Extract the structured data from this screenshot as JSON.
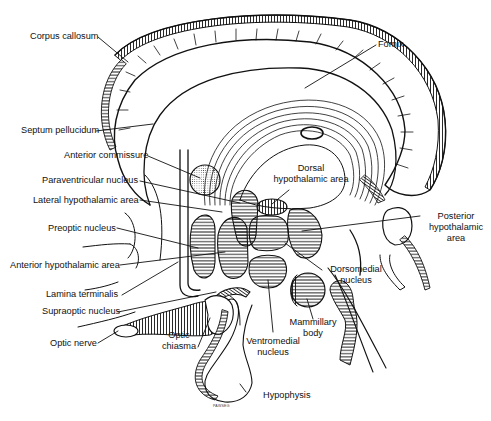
{
  "figure": {
    "ink_color": "#111111",
    "background_color": "#ffffff",
    "signature": "PAWSEG"
  },
  "labels": {
    "corpus_callosum": "Corpus callosum",
    "fornix": "Fornix",
    "septum_pellucidum": "Septum pellucidum",
    "anterior_commissure": "Anterior commissure",
    "paraventricular_nucleus": "Paraventricular nucleus",
    "lateral_hypothalamic_area": "Lateral hypothalamic area",
    "preoptic_nucleus": "Preoptic nucleus",
    "anterior_hypothalamic_area": "Anterior hypothalamic area",
    "lamina_terminalis": "Lamina terminalis",
    "supraoptic_nucleus": "Supraoptic nucleus",
    "optic_nerve": "Optic nerve",
    "optic_chiasma_1": "Optic",
    "optic_chiasma_2": "chiasma",
    "dorsal_hypothalamic_area_1": "Dorsal",
    "dorsal_hypothalamic_area_2": "hypothalamic area",
    "posterior_hypothalamic_area_1": "Posterior",
    "posterior_hypothalamic_area_2": "hypothalamic",
    "posterior_hypothalamic_area_3": "area",
    "dorsomedial_nucleus_1": "Dorsomedial",
    "dorsomedial_nucleus_2": "nucleus",
    "mammillary_body_1": "Mammillary",
    "mammillary_body_2": "body",
    "ventromedial_nucleus_1": "Ventromedial",
    "ventromedial_nucleus_2": "nucleus",
    "hypophysis": "Hypophysis"
  }
}
